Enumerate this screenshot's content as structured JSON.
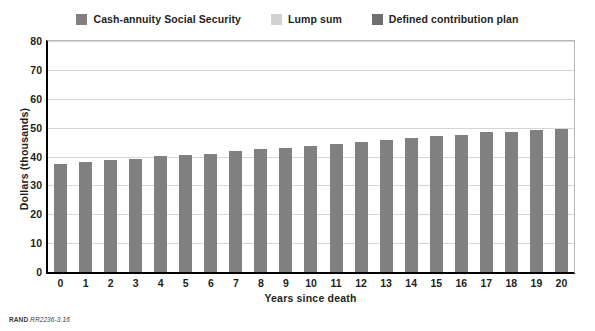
{
  "chart_data": {
    "type": "bar",
    "stacked": true,
    "title": "",
    "xlabel": "Years since death",
    "ylabel": "Dollars (thousands)",
    "categories": [
      "0",
      "1",
      "2",
      "3",
      "4",
      "5",
      "6",
      "7",
      "8",
      "9",
      "10",
      "11",
      "12",
      "13",
      "14",
      "15",
      "16",
      "17",
      "18",
      "19",
      "20"
    ],
    "ylim": [
      0,
      80
    ],
    "yticks": [
      0,
      10,
      20,
      30,
      40,
      50,
      60,
      70,
      80
    ],
    "grid": true,
    "legend_position": "top-center",
    "series": [
      {
        "name": "Cash-annuity Social Security",
        "color": "#808080",
        "values": [
          37.0,
          37.5,
          38.3,
          38.8,
          39.5,
          40.0,
          40.5,
          41.3,
          42.0,
          42.5,
          43.2,
          43.8,
          44.3,
          45.0,
          45.8,
          46.5,
          47.0,
          47.8,
          48.0,
          48.7,
          49.0
        ]
      },
      {
        "name": "Lump sum",
        "color": "#d2d2d2",
        "values": [
          0,
          0,
          0,
          0,
          0,
          0,
          0,
          0,
          0,
          0,
          0,
          0,
          0,
          0,
          0,
          0,
          0,
          0,
          0,
          0,
          0
        ]
      },
      {
        "name": "Defined contribution plan",
        "color": "#6e6e6e",
        "values": [
          0,
          0,
          0,
          0,
          0,
          0,
          0,
          0,
          0,
          0,
          0,
          0,
          0,
          0,
          0,
          0,
          0,
          0,
          0,
          0,
          0
        ]
      }
    ],
    "totals": [
      37.0,
      37.5,
      38.3,
      38.8,
      39.5,
      40.0,
      40.5,
      41.3,
      42.0,
      42.5,
      43.2,
      43.8,
      44.3,
      45.0,
      45.8,
      46.5,
      47.0,
      47.8,
      48.0,
      48.7,
      49.0
    ]
  },
  "legend": {
    "items": [
      {
        "label": "Cash-annuity Social Security",
        "color": "#808080"
      },
      {
        "label": "Lump sum",
        "color": "#d2d2d2"
      },
      {
        "label": "Defined contribution plan",
        "color": "#6e6e6e"
      }
    ]
  },
  "footer": {
    "brand": "RAND",
    "figure_number": "RR2236-3.16"
  },
  "colors": {
    "axis": "#000000",
    "gridline": "#d6d6d6",
    "frame": "#b9b9b9",
    "text": "#231f20"
  }
}
